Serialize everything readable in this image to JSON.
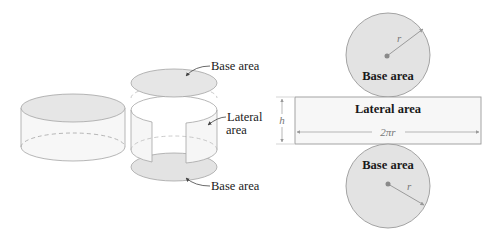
{
  "figure": {
    "panels": [
      {
        "id": "solid-cylinder",
        "description": "Closed cylinder"
      },
      {
        "id": "exploded-cylinder",
        "description": "Cylinder separated into two bases and lateral surface"
      },
      {
        "id": "net",
        "description": "Flattened net: two circular bases and a rectangular lateral area"
      }
    ]
  },
  "labels": {
    "exploded_top_base": "Base area",
    "exploded_lateral_line1": "Lateral",
    "exploded_lateral_line2": "area",
    "exploded_bottom_base": "Base area",
    "net_top_base": "Base area",
    "net_lateral": "Lateral area",
    "net_bottom_base": "Base area",
    "radius_top": "r",
    "radius_bottom": "r",
    "height": "h",
    "circumference": "2πr"
  },
  "colors": {
    "base_fill": "#e3e3e3",
    "lateral_fill": "#f5f5f5",
    "stroke": "#9a9a9a",
    "dot": "#8a8a8a",
    "text": "#1a1a1a",
    "dim_text": "#777777"
  }
}
